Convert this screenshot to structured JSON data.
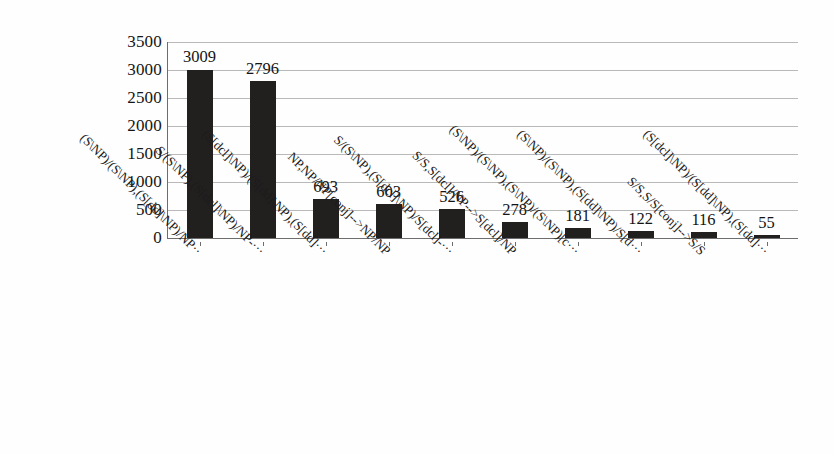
{
  "chart_data": {
    "type": "bar",
    "title": "",
    "subtitle": "",
    "xlabel": "",
    "ylabel": "",
    "ylim": [
      0,
      3500
    ],
    "grid": true,
    "legend": null,
    "orientation": "vertical",
    "bar_color": "#221f1f",
    "gridline_color": "#b9b9b9",
    "axis_color": "#6d6d6d",
    "yticks": [
      3500,
      3000,
      2500,
      2000,
      1500,
      1000,
      500,
      0
    ],
    "ytick_labels": [
      "3500",
      "3000",
      "2500",
      "2000",
      "1500",
      "1000",
      "500",
      "0"
    ],
    "categories": [
      "(S\\NP)/(S\\NP),(S[dd]\\NP)/NP··",
      "S/(S\\NP),(S[dcl]\\NP)/NP-···",
      "(S[dcl]\\NP)/(S[dd]\\NP),(S[dd]···",
      "NP,NP/NP[conj]-->NP/NP",
      "S/(S\\NP),(S[dcl]\\NP)/S[dcl]-···",
      "S/S,S[dcl]/NP-->S[dcl]/NP",
      "(S\\NP)/(S\\NP),(S\\NP)/(S\\NP)[c···",
      "(S\\NP)/(S\\NP),(S[dd]\\NP)/S[d···",
      "S/S,S/S[conj]-->S/S",
      "(S[dcl]\\NP)/(S[dd]\\NP),(S[dd]···"
    ],
    "values": [
      3009,
      2796,
      693,
      603,
      526,
      278,
      181,
      122,
      116,
      55
    ],
    "value_labels": [
      "3009",
      "2796",
      "693",
      "603",
      "526",
      "278",
      "181",
      "122",
      "116",
      "55"
    ]
  }
}
